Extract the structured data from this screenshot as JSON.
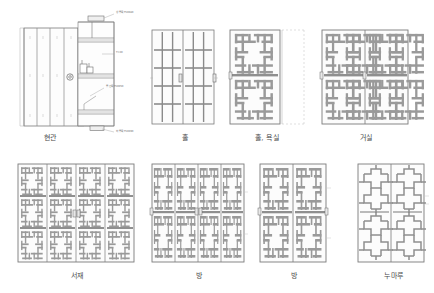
{
  "sheet": {
    "title": "문 입면 상세도",
    "background": "#ffffff",
    "line_color": "#6e6e6e",
    "frame_color": "#8a8a8a",
    "fill_color": "#f2f2f2",
    "text_color": "#4a4a4a"
  },
  "figures": [
    {
      "id": "hyeongwan",
      "caption": "현관",
      "type": "entrance-door-elevation-section",
      "leaves": 1,
      "pattern": "vertical-board",
      "notes": "입면 + 단면 상세, 널판문",
      "annotations": [
        {
          "id": "top-rail",
          "text": "상 중 목 T50X80"
        },
        {
          "id": "board",
          "text": "T=30"
        },
        {
          "id": "mid-rail",
          "text": "중 간 목 T50X50"
        },
        {
          "id": "bottom-rail",
          "text": "하 중 목 T50X90"
        }
      ]
    },
    {
      "id": "hol",
      "caption": "홀",
      "type": "sliding-door-elevation",
      "leaves": 2,
      "pattern": "grid",
      "cells_x": 3,
      "cells_y": 5
    },
    {
      "id": "hol-yoksil",
      "caption": "홀, 욕실",
      "type": "sliding-door-elevation",
      "leaves": 1,
      "pattern": "pinwheel",
      "motif_x": 1,
      "motif_y": 2
    },
    {
      "id": "geosil",
      "caption": "거실",
      "type": "sliding-door-elevation",
      "leaves": 2,
      "pattern": "pinwheel",
      "motif_x": 2,
      "motif_y": 2
    },
    {
      "id": "seojae",
      "caption": "서재",
      "type": "sliding-door-elevation",
      "leaves": 4,
      "pattern": "pinwheel",
      "motif_x": 2,
      "motif_y": 3
    },
    {
      "id": "bang-1",
      "caption": "방",
      "type": "sliding-door-elevation",
      "leaves": 4,
      "pattern": "pinwheel",
      "motif_x": 1,
      "motif_y": 2
    },
    {
      "id": "bang-2",
      "caption": "방",
      "type": "sliding-door-elevation",
      "leaves": 2,
      "pattern": "pinwheel",
      "motif_x": 1,
      "motif_y": 2
    },
    {
      "id": "numaru",
      "caption": "누마루",
      "type": "sliding-door-elevation",
      "leaves": 2,
      "pattern": "cross-lattice",
      "motif_x": 1,
      "motif_y": 2
    }
  ]
}
